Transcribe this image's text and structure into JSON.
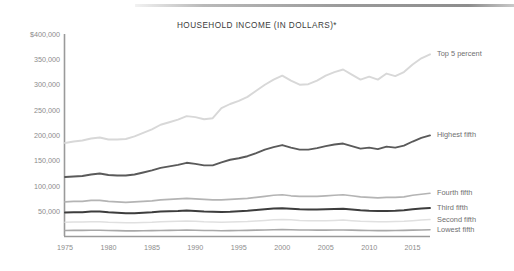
{
  "chart_data": {
    "type": "line",
    "title": "HOUSEHOLD INCOME (IN DOLLARS)*",
    "xlabel": "",
    "ylabel": "",
    "grid": false,
    "legend_position": "right-inline-labels",
    "xlim": [
      1975,
      2017
    ],
    "ylim": [
      0,
      400000
    ],
    "x_ticks": [
      "1975",
      "1980",
      "1985",
      "1990",
      "1995",
      "2000",
      "2005",
      "2010",
      "2015"
    ],
    "y_ticks": [
      "$400,000",
      "350,000",
      "300,000",
      "250,000",
      "200,000",
      "150,000",
      "100,000",
      "50,000"
    ],
    "y_tick_values": [
      400000,
      350000,
      300000,
      250000,
      200000,
      150000,
      100000,
      50000
    ],
    "x": [
      1975,
      1976,
      1977,
      1978,
      1979,
      1980,
      1981,
      1982,
      1983,
      1984,
      1985,
      1986,
      1987,
      1988,
      1989,
      1990,
      1991,
      1992,
      1993,
      1994,
      1995,
      1996,
      1997,
      1998,
      1999,
      2000,
      2001,
      2002,
      2003,
      2004,
      2005,
      2006,
      2007,
      2008,
      2009,
      2010,
      2011,
      2012,
      2013,
      2014,
      2015,
      2016,
      2017
    ],
    "series": [
      {
        "name": "Top 5 percent",
        "color": "#d8d8d8",
        "label": "Top 5 percent",
        "values": [
          185000,
          188000,
          190000,
          194000,
          196000,
          192000,
          192000,
          193000,
          198000,
          205000,
          212000,
          221000,
          226000,
          231000,
          238000,
          236000,
          232000,
          234000,
          254000,
          262000,
          268000,
          276000,
          288000,
          300000,
          310000,
          318000,
          308000,
          300000,
          301000,
          308000,
          318000,
          325000,
          330000,
          320000,
          310000,
          316000,
          310000,
          322000,
          317000,
          325000,
          340000,
          352000,
          360000
        ]
      },
      {
        "name": "Highest fifth",
        "color": "#5a5a5a",
        "label": "Highest fifth",
        "values": [
          118000,
          119000,
          120000,
          123000,
          125000,
          122000,
          121000,
          121000,
          123000,
          127000,
          131000,
          136000,
          139000,
          142000,
          146000,
          144000,
          141000,
          141000,
          147000,
          152000,
          155000,
          159000,
          165000,
          172000,
          177000,
          181000,
          176000,
          172000,
          172000,
          175000,
          179000,
          182000,
          184000,
          179000,
          174000,
          176000,
          173000,
          178000,
          176000,
          180000,
          188000,
          195000,
          200000
        ]
      },
      {
        "name": "Fourth fifth",
        "color": "#b4b4b4",
        "label": "Fourth fifth",
        "values": [
          69000,
          70000,
          70000,
          72000,
          72000,
          70000,
          69000,
          68000,
          69000,
          70000,
          71000,
          73000,
          74000,
          75000,
          76000,
          75000,
          74000,
          73000,
          73000,
          74000,
          75000,
          76000,
          78000,
          80000,
          82000,
          83000,
          81000,
          80000,
          80000,
          80000,
          81000,
          82000,
          83000,
          81000,
          79000,
          78000,
          77000,
          78000,
          78000,
          79000,
          82000,
          84000,
          86000
        ]
      },
      {
        "name": "Third fifth",
        "color": "#3d3d3d",
        "label": "Third fifth",
        "values": [
          48000,
          48500,
          48500,
          50000,
          50000,
          48500,
          47500,
          46500,
          46500,
          47500,
          48500,
          50000,
          50500,
          51000,
          52000,
          51000,
          50000,
          49500,
          49000,
          49500,
          50500,
          51500,
          53000,
          54500,
          56000,
          56500,
          55500,
          54500,
          54000,
          54000,
          54500,
          55000,
          55500,
          54000,
          52500,
          51500,
          51000,
          51000,
          51500,
          52500,
          54500,
          56000,
          57000
        ]
      },
      {
        "name": "Second fifth",
        "color": "#e0e0e0",
        "label": "Second fifth",
        "values": [
          29000,
          29500,
          29500,
          30000,
          30000,
          29000,
          28500,
          28000,
          28000,
          28500,
          29000,
          30000,
          30500,
          31000,
          31500,
          31000,
          30000,
          29500,
          29000,
          29500,
          30000,
          30500,
          31500,
          32500,
          33500,
          34000,
          33500,
          32500,
          32000,
          32000,
          32000,
          32500,
          33000,
          32000,
          31000,
          30500,
          30000,
          30000,
          30500,
          31000,
          32000,
          33000,
          34000
        ]
      },
      {
        "name": "Lowest fifth",
        "color": "#a8a8a8",
        "label": "Lowest fifth",
        "values": [
          12500,
          12700,
          12700,
          13000,
          13000,
          12500,
          12200,
          11800,
          11700,
          12000,
          12200,
          12600,
          12800,
          13000,
          13200,
          13000,
          12600,
          12400,
          12000,
          12200,
          12600,
          12800,
          13200,
          13600,
          14000,
          14200,
          14000,
          13600,
          13400,
          13300,
          13300,
          13500,
          13600,
          13200,
          12800,
          12500,
          12300,
          12200,
          12400,
          12700,
          13200,
          13600,
          14000
        ]
      }
    ]
  }
}
